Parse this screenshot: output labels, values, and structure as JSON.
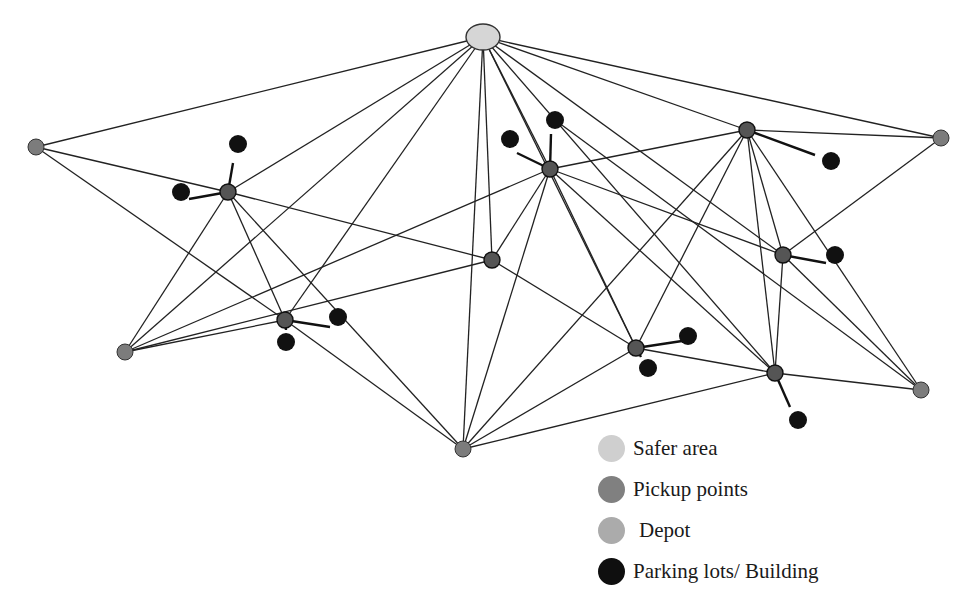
{
  "figure": {
    "top_caption_fragment": ""
  },
  "colors": {
    "safer_area": "#d6d6d6",
    "pickup": "#7c7c7c",
    "depot": "#a9a9a9",
    "parking": "#111111",
    "edge": "#222222"
  },
  "legend": [
    {
      "key": "safer_area",
      "label": "Safer area",
      "color": "#cfcfcf"
    },
    {
      "key": "pickup",
      "label": "Pickup points",
      "color": "#808080"
    },
    {
      "key": "depot",
      "label": "Depot",
      "color": "#ababab"
    },
    {
      "key": "parking",
      "label": "Parking lots/ Building",
      "color": "#0f0f0f"
    }
  ],
  "nodes": {
    "safer_area": [
      {
        "id": "S",
        "x": 483,
        "y": 37,
        "rx": 17,
        "ry": 13
      }
    ],
    "depots": [
      {
        "id": "D1",
        "x": 36,
        "y": 147
      },
      {
        "id": "D2",
        "x": 125,
        "y": 352
      },
      {
        "id": "D3",
        "x": 463,
        "y": 449
      },
      {
        "id": "D4",
        "x": 941,
        "y": 138
      },
      {
        "id": "D5",
        "x": 921,
        "y": 390
      }
    ],
    "pickups": [
      {
        "id": "P1",
        "x": 228,
        "y": 192
      },
      {
        "id": "P2",
        "x": 285,
        "y": 320
      },
      {
        "id": "P3",
        "x": 492,
        "y": 260
      },
      {
        "id": "P4",
        "x": 550,
        "y": 169
      },
      {
        "id": "P5",
        "x": 747,
        "y": 130
      },
      {
        "id": "P6",
        "x": 783,
        "y": 255
      },
      {
        "id": "P7",
        "x": 636,
        "y": 348
      },
      {
        "id": "P8",
        "x": 775,
        "y": 373
      }
    ],
    "parking": [
      {
        "id": "B1",
        "x": 238,
        "y": 144,
        "to": "P1",
        "ex": 233,
        "ey": 163
      },
      {
        "id": "B2",
        "x": 181,
        "y": 192,
        "to": "P1",
        "ex": 189,
        "ey": 199
      },
      {
        "id": "B3",
        "x": 510,
        "y": 139,
        "to": "P4",
        "ex": 517,
        "ey": 153
      },
      {
        "id": "B4",
        "x": 555,
        "y": 120,
        "to": "P4",
        "ex": 551,
        "ey": 134
      },
      {
        "id": "B5",
        "x": 338,
        "y": 317,
        "to": "P2",
        "ex": 330,
        "ey": 327
      },
      {
        "id": "B6",
        "x": 286,
        "y": 342,
        "to": "P2",
        "ex": 286,
        "ey": 330
      },
      {
        "id": "B7",
        "x": 831,
        "y": 161,
        "to": "P5",
        "ex": 815,
        "ey": 155
      },
      {
        "id": "B8",
        "x": 835,
        "y": 255,
        "to": "P6",
        "ex": 826,
        "ey": 263
      },
      {
        "id": "B9",
        "x": 688,
        "y": 336,
        "to": "P7",
        "ex": 682,
        "ey": 341
      },
      {
        "id": "B10",
        "x": 648,
        "y": 368,
        "to": "P7",
        "ex": 641,
        "ey": 357
      },
      {
        "id": "B11",
        "x": 798,
        "y": 420,
        "to": "P8",
        "ex": 790,
        "ey": 407
      }
    ]
  },
  "edges": [
    [
      "S",
      "D1"
    ],
    [
      "S",
      "P1"
    ],
    [
      "S",
      "P2"
    ],
    [
      "S",
      "D2"
    ],
    [
      "S",
      "D3"
    ],
    [
      "S",
      "P3"
    ],
    [
      "S",
      "P4"
    ],
    [
      "S",
      "P7"
    ],
    [
      "S",
      "P6"
    ],
    [
      "S",
      "P8"
    ],
    [
      "S",
      "P5"
    ],
    [
      "S",
      "D4"
    ],
    [
      "D1",
      "P1"
    ],
    [
      "D1",
      "P2"
    ],
    [
      "P1",
      "P3"
    ],
    [
      "P1",
      "P2"
    ],
    [
      "P1",
      "D2"
    ],
    [
      "P1",
      "D3"
    ],
    [
      "D2",
      "P2"
    ],
    [
      "D2",
      "P3"
    ],
    [
      "D2",
      "P4"
    ],
    [
      "P2",
      "D3"
    ],
    [
      "P3",
      "P4"
    ],
    [
      "P3",
      "P7"
    ],
    [
      "P4",
      "D3"
    ],
    [
      "P4",
      "P5"
    ],
    [
      "P4",
      "P7"
    ],
    [
      "P4",
      "P6"
    ],
    [
      "P4",
      "P8"
    ],
    [
      "D3",
      "P5"
    ],
    [
      "D3",
      "P7"
    ],
    [
      "D3",
      "P8"
    ],
    [
      "P5",
      "P7"
    ],
    [
      "P5",
      "P6"
    ],
    [
      "P5",
      "P8"
    ],
    [
      "P5",
      "D4"
    ],
    [
      "P5",
      "D5"
    ],
    [
      "D4",
      "P6"
    ],
    [
      "P6",
      "P8"
    ],
    [
      "P6",
      "D5"
    ],
    [
      "P7",
      "P8"
    ],
    [
      "P8",
      "D5"
    ],
    [
      "B4",
      "D5"
    ]
  ]
}
